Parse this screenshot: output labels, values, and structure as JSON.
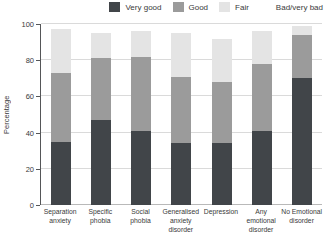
{
  "legend": {
    "items": [
      {
        "label": "Very good",
        "color": "#414549"
      },
      {
        "label": "Good",
        "color": "#9b9b9b"
      },
      {
        "label": "Fair",
        "color": "#e4e4e4"
      },
      {
        "label": "Bad/very bad",
        "color": "#ffffff"
      }
    ]
  },
  "y_axis": {
    "label": "Percentage",
    "ticks": [
      100,
      80,
      60,
      40,
      20,
      0
    ]
  },
  "chart_data": {
    "type": "bar",
    "stacked": true,
    "title": "",
    "xlabel": "",
    "ylabel": "Percentage",
    "ylim": [
      0,
      100
    ],
    "grid": true,
    "legend_position": "top",
    "categories": [
      "Separation anxiety",
      "Specific phobia",
      "Social phobia",
      "Generalised anxiety disorder",
      "Depression",
      "Any emotional disorder",
      "No Emotional disorder"
    ],
    "series": [
      {
        "name": "Very good",
        "color": "#414549",
        "values": [
          35,
          47,
          41,
          34,
          34,
          41,
          70
        ]
      },
      {
        "name": "Good",
        "color": "#9b9b9b",
        "values": [
          38,
          34,
          41,
          37,
          34,
          37,
          24
        ]
      },
      {
        "name": "Fair",
        "color": "#e4e4e4",
        "values": [
          24,
          14,
          14,
          24,
          24,
          18,
          5
        ]
      },
      {
        "name": "Bad/very bad",
        "color": "#ffffff",
        "values": [
          3,
          5,
          4,
          5,
          8,
          4,
          1
        ]
      }
    ]
  }
}
